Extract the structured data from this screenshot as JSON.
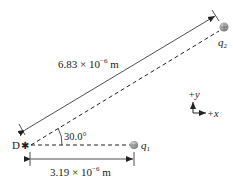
{
  "diagram": {
    "point_label": "D",
    "charges": {
      "q1": {
        "label": "q",
        "sub": "1"
      },
      "q2": {
        "label": "q",
        "sub": "2"
      }
    },
    "distances": {
      "diagonal": {
        "mantissa": "6.83 × 10",
        "exp": "−6",
        "unit": " m"
      },
      "horizontal": {
        "mantissa": "3.19 × 10",
        "exp": "−6",
        "unit": " m"
      }
    },
    "angle": "30.0°",
    "axes": {
      "y": "+y",
      "x": "+x"
    },
    "colors": {
      "line": "#222222",
      "charge": "#9a9a9a"
    }
  }
}
